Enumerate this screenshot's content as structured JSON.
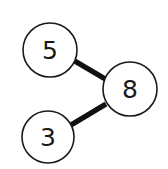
{
  "diagram": {
    "type": "tree",
    "nodes": [
      {
        "id": "n5",
        "label": "5",
        "cx": 50,
        "cy": 50,
        "r": 27
      },
      {
        "id": "n8",
        "label": "8",
        "cx": 130,
        "cy": 89,
        "r": 27
      },
      {
        "id": "n3",
        "label": "3",
        "cx": 48,
        "cy": 137,
        "r": 26
      }
    ],
    "edges": [
      {
        "from": "n5",
        "to": "n8"
      },
      {
        "from": "n3",
        "to": "n8"
      }
    ],
    "colors": {
      "stroke": "#1a1a1a",
      "edge": "#111111",
      "fill": "#ffffff"
    }
  }
}
